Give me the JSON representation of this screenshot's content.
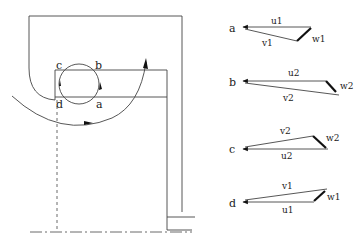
{
  "diagram": {
    "left_figure": {
      "point_labels": [
        "a",
        "b",
        "c",
        "d"
      ],
      "description": "Cross-section with circular orbit through points a, b, c, d and large sweeping arc arrow"
    },
    "velocity_triangles": [
      {
        "point": "a",
        "u": "u1",
        "v": "v1",
        "w": "w1"
      },
      {
        "point": "b",
        "u": "u2",
        "v": "v2",
        "w": "w2"
      },
      {
        "point": "c",
        "u": "u2",
        "v": "v2",
        "w": "w2"
      },
      {
        "point": "d",
        "u": "u1",
        "v": "v1",
        "w": "w1"
      }
    ],
    "colors": {
      "line": "#444444",
      "text": "#222222",
      "background": "#ffffff"
    }
  }
}
